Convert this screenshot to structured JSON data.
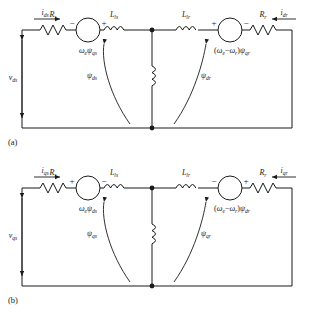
{
  "figure": {
    "type": "equivalent-circuit-diagram",
    "background": "#ffffff",
    "line_color": "#1a1a1a"
  },
  "circuits": [
    {
      "id": "a",
      "caption": "(a)",
      "axis": "d-axis",
      "source_voltage_label": "v",
      "source_voltage_sub": "ds",
      "left_current": {
        "label": "i",
        "sub": "ds",
        "direction": "right"
      },
      "right_current": {
        "label": "i",
        "sub": "dr",
        "direction": "left"
      },
      "stator_resistor": {
        "label": "R",
        "sub": "s"
      },
      "rotor_resistor": {
        "label": "R",
        "sub": "r"
      },
      "stator_leakage_inductor": {
        "label": "L",
        "sub": "ls"
      },
      "rotor_leakage_inductor": {
        "label": "L",
        "sub": "lr"
      },
      "magnetizing_inductor": {
        "label": ""
      },
      "left_source": {
        "expression": "ωeψqs",
        "omega": "ω",
        "omega_sub": "e",
        "psi": "ψ",
        "psi_sub": "qs",
        "polarity_left": "−",
        "polarity_right": "+"
      },
      "right_source": {
        "expression": "(ωe − ωr)ψqr",
        "omega1_sub": "e",
        "omega2_sub": "r",
        "psi": "ψ",
        "psi_sub": "qr",
        "polarity_left": "+",
        "polarity_right": "−"
      },
      "flux_annotations": [
        {
          "psi": "ψ",
          "sub": "ds",
          "points_to": "stator-branch"
        },
        {
          "psi": "ψ",
          "sub": "dr",
          "points_to": "rotor-branch"
        }
      ]
    },
    {
      "id": "b",
      "caption": "(b)",
      "axis": "q-axis",
      "source_voltage_label": "v",
      "source_voltage_sub": "qs",
      "left_current": {
        "label": "i",
        "sub": "qs",
        "direction": "right"
      },
      "right_current": {
        "label": "i",
        "sub": "qr",
        "direction": "left"
      },
      "stator_resistor": {
        "label": "R",
        "sub": "s"
      },
      "rotor_resistor": {
        "label": "R",
        "sub": "r"
      },
      "stator_leakage_inductor": {
        "label": "L",
        "sub": "ls"
      },
      "rotor_leakage_inductor": {
        "label": "L",
        "sub": "lr"
      },
      "magnetizing_inductor": {
        "label": ""
      },
      "left_source": {
        "expression": "ωeψds",
        "omega": "ω",
        "omega_sub": "e",
        "psi": "ψ",
        "psi_sub": "ds",
        "polarity_left": "+",
        "polarity_right": "−"
      },
      "right_source": {
        "expression": "(ωe − ωr)ψdr",
        "omega1_sub": "e",
        "omega2_sub": "r",
        "psi": "ψ",
        "psi_sub": "dr",
        "polarity_left": "−",
        "polarity_right": "+"
      },
      "flux_annotations": [
        {
          "psi": "ψ",
          "sub": "qs",
          "points_to": "stator-branch"
        },
        {
          "psi": "ψ",
          "sub": "qr",
          "points_to": "rotor-branch"
        }
      ]
    }
  ],
  "glyphs": {
    "omega": "ω",
    "psi": "ψ",
    "minus": "−",
    "plus": "+"
  }
}
